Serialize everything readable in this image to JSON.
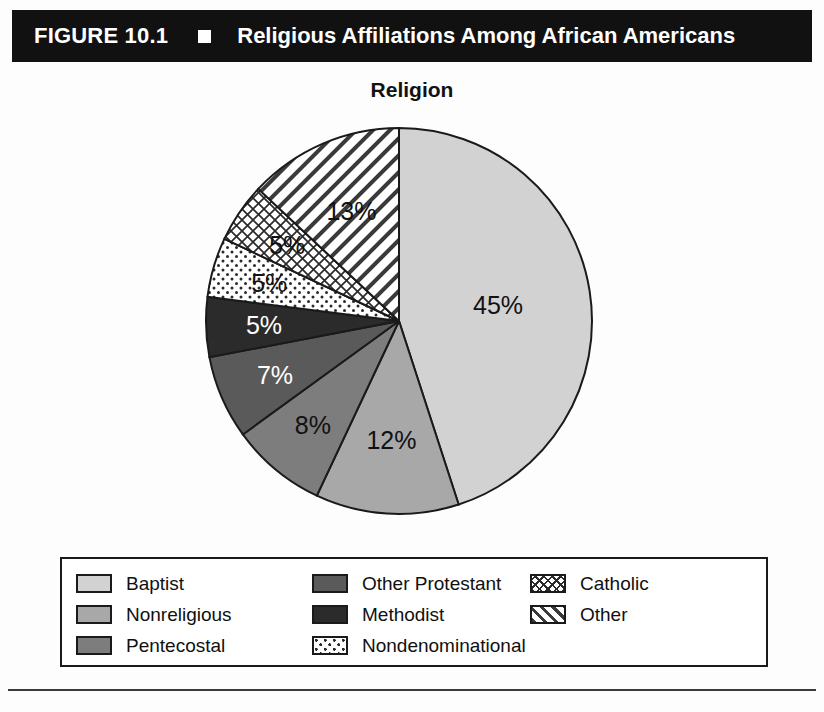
{
  "figure": {
    "number": "FIGURE 10.1",
    "bullet_icon": "black-square-icon",
    "title": "Religious Affiliations Among African Americans"
  },
  "chart_title": "Religion",
  "legend": {
    "items": [
      {
        "label": "Baptist",
        "swatch": "solid-light-gray",
        "color": "#d2d2d2"
      },
      {
        "label": "Nonreligious",
        "swatch": "solid-medium-gray",
        "color": "#a8a8a8"
      },
      {
        "label": "Pentecostal",
        "swatch": "solid-gray",
        "color": "#7d7d7d"
      },
      {
        "label": "Other Protestant",
        "swatch": "solid-dark-gray",
        "color": "#5a5a5a"
      },
      {
        "label": "Methodist",
        "swatch": "solid-near-black",
        "color": "#2b2b2b"
      },
      {
        "label": "Nondenominational",
        "swatch": "dotted-pattern",
        "color": "#ffffff"
      },
      {
        "label": "Catholic",
        "swatch": "crosshatch-pattern",
        "color": "#ffffff"
      },
      {
        "label": "Other",
        "swatch": "diagonal-hatch",
        "color": "#ffffff"
      }
    ]
  },
  "chart_data": {
    "type": "pie",
    "title": "Religion",
    "xlabel": "",
    "ylabel": "",
    "units": "percent",
    "start_angle_deg": 0,
    "direction": "clockwise",
    "legend_position": "bottom",
    "grid": false,
    "categories": [
      "Baptist",
      "Nonreligious",
      "Pentecostal",
      "Other Protestant",
      "Methodist",
      "Nondenominational",
      "Catholic",
      "Other"
    ],
    "values": [
      45,
      12,
      8,
      7,
      5,
      5,
      5,
      13
    ],
    "data_labels": [
      "45%",
      "12%",
      "8%",
      "7%",
      "5%",
      "5%",
      "5%",
      "13%"
    ],
    "slices": [
      {
        "label": "Baptist",
        "value": 45,
        "data_label": "45%",
        "fill": "solid-light-gray",
        "color": "#d2d2d2",
        "label_color": "#111111"
      },
      {
        "label": "Nonreligious",
        "value": 12,
        "data_label": "12%",
        "fill": "solid-medium-gray",
        "color": "#a8a8a8",
        "label_color": "#111111"
      },
      {
        "label": "Pentecostal",
        "value": 8,
        "data_label": "8%",
        "fill": "solid-gray",
        "color": "#7d7d7d",
        "label_color": "#111111"
      },
      {
        "label": "Other Protestant",
        "value": 7,
        "data_label": "7%",
        "fill": "solid-dark-gray",
        "color": "#5a5a5a",
        "label_color": "#ffffff"
      },
      {
        "label": "Methodist",
        "value": 5,
        "data_label": "5%",
        "fill": "solid-near-black",
        "color": "#2b2b2b",
        "label_color": "#ffffff"
      },
      {
        "label": "Nondenominational",
        "value": 5,
        "data_label": "5%",
        "fill": "dotted-pattern",
        "color": "#ffffff",
        "label_color": "#111111"
      },
      {
        "label": "Catholic",
        "value": 5,
        "data_label": "5%",
        "fill": "crosshatch-pattern",
        "color": "#ffffff",
        "label_color": "#111111"
      },
      {
        "label": "Other",
        "value": 13,
        "data_label": "13%",
        "fill": "diagonal-hatch",
        "color": "#ffffff",
        "label_color": "#111111"
      }
    ],
    "total": 100
  }
}
